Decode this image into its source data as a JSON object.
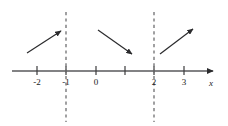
{
  "figure": {
    "kind": "number-line-slope-field",
    "background_color": "#ffffff",
    "axis_color": "#59595b",
    "tick_color": "#3b3b3d",
    "dash_color": "#6e6e70",
    "arrow_color": "#2b2b2d",
    "label_color": "#1a1a1a"
  },
  "chart_data": {
    "type": "line",
    "title": "",
    "xlabel": "x",
    "ylabel": "",
    "grid": false,
    "legend": null,
    "xlim": [
      -2.8,
      3.9
    ],
    "axis": {
      "label": "x",
      "label_x": 209,
      "label_y": 79,
      "start_px": 12,
      "end_px": 213,
      "y_px": 71,
      "arrow_end": "right"
    },
    "ticks": [
      {
        "value": -2,
        "label": "-2",
        "x_px": 37,
        "labeled": true
      },
      {
        "value": -1,
        "label": "-1",
        "x_px": 66,
        "labeled": true
      },
      {
        "value": 0,
        "label": "0",
        "x_px": 96,
        "labeled": true
      },
      {
        "value": 1,
        "label": "",
        "x_px": 125,
        "labeled": false
      },
      {
        "value": 2,
        "label": "2",
        "x_px": 154,
        "labeled": true
      },
      {
        "value": 3,
        "label": "3",
        "x_px": 184,
        "labeled": true
      }
    ],
    "tick_label_y_px": 78,
    "dashed_lines": [
      {
        "value": -1,
        "x_px": 66,
        "y_top": 12,
        "y_bottom": 122
      },
      {
        "value": 2,
        "x_px": 154,
        "y_top": 12,
        "y_bottom": 122
      }
    ],
    "arrows": [
      {
        "name": "arrow-left-increasing",
        "direction": "up-right",
        "slope_sign": "positive",
        "x1": 27,
        "y1": 53,
        "x2": 61,
        "y2": 31
      },
      {
        "name": "arrow-middle-decreasing",
        "direction": "down-right",
        "slope_sign": "negative",
        "x1": 98,
        "y1": 30,
        "x2": 132,
        "y2": 54
      },
      {
        "name": "arrow-right-increasing",
        "direction": "up-right",
        "slope_sign": "positive",
        "x1": 160,
        "y1": 54,
        "x2": 193,
        "y2": 29
      }
    ]
  }
}
